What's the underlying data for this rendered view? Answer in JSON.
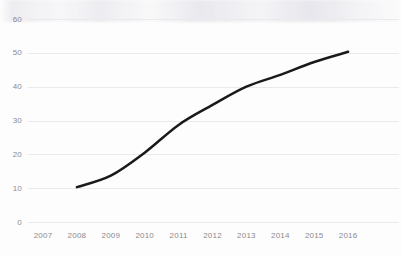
{
  "chart_data": {
    "type": "line",
    "title": "",
    "subtitle": "",
    "xlabel": "",
    "ylabel": "",
    "x": [
      2007,
      2008,
      2009,
      2010,
      2011,
      2012,
      2013,
      2014,
      2015,
      2016
    ],
    "xtick_labels": [
      "2007",
      "2008",
      "2009",
      "2010",
      "2011",
      "2012",
      "2013",
      "2014",
      "2015",
      "2016"
    ],
    "ytick_labels": [
      "0",
      "10",
      "20",
      "30",
      "40",
      "50",
      "60"
    ],
    "ytick_values": [
      0,
      10,
      20,
      30,
      40,
      50,
      60
    ],
    "ylim": [
      0,
      60
    ],
    "xlim": [
      2007,
      2016
    ],
    "grid": "horizontal",
    "legend": "none",
    "series": [
      {
        "name": "",
        "color": "#1a1a1a",
        "line_width": 2.5,
        "markers": "none",
        "x": [
          2008,
          2009,
          2010,
          2011,
          2012,
          2013,
          2014,
          2015,
          2016
        ],
        "values": [
          10.3,
          13.7,
          20.5,
          28.7,
          34.6,
          40.0,
          43.5,
          47.3,
          50.3
        ]
      }
    ],
    "annotations": []
  },
  "colors": {
    "background": "#fdfdfd",
    "gridline": "#e9e9ee",
    "tick_label": "#8a8a8f",
    "series_line": "#1a1a1a"
  }
}
